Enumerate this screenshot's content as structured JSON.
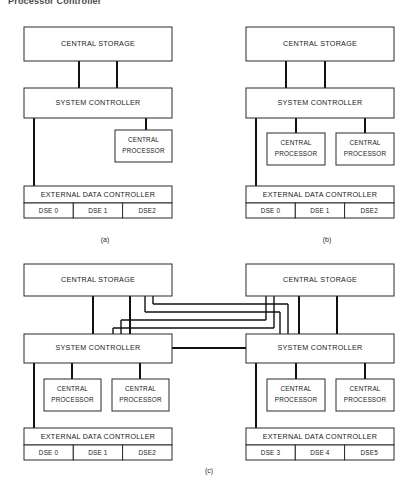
{
  "figure": {
    "title": "Processor Controller",
    "captions": {
      "a": "(a)",
      "b": "(b)",
      "c": "(c)"
    }
  },
  "labels": {
    "central_storage": "CENTRAL STORAGE",
    "system_controller": "SYSTEM CONTROLLER",
    "central_processor_line1": "CENTRAL",
    "central_processor_line2": "PROCESSOR",
    "external_data_controller": "EXTERNAL DATA CONTROLLER"
  },
  "panels": {
    "a": {
      "caption": "(a)",
      "central_storage": "CENTRAL STORAGE",
      "system_controller": "SYSTEM CONTROLLER",
      "external_data_controller": "EXTERNAL DATA CONTROLLER",
      "processors": [
        {
          "line1": "CENTRAL",
          "line2": "PROCESSOR"
        }
      ],
      "dse": [
        "DSE 0",
        "DSE 1",
        "DSE2"
      ]
    },
    "b": {
      "caption": "(b)",
      "central_storage": "CENTRAL STORAGE",
      "system_controller": "SYSTEM CONTROLLER",
      "external_data_controller": "EXTERNAL DATA CONTROLLER",
      "processors": [
        {
          "line1": "CENTRAL",
          "line2": "PROCESSOR"
        },
        {
          "line1": "CENTRAL",
          "line2": "PROCESSOR"
        }
      ],
      "dse": [
        "DSE 0",
        "DSE 1",
        "DSE2"
      ]
    },
    "c": {
      "caption": "(c)",
      "left": {
        "central_storage": "CENTRAL STORAGE",
        "system_controller": "SYSTEM CONTROLLER",
        "external_data_controller": "EXTERNAL DATA CONTROLLER",
        "processors": [
          {
            "line1": "CENTRAL",
            "line2": "PROCESSOR"
          },
          {
            "line1": "CENTRAL",
            "line2": "PROCESSOR"
          }
        ],
        "dse": [
          "DSE 0",
          "DSE 1",
          "DSE2"
        ]
      },
      "right": {
        "central_storage": "CENTRAL STORAGE",
        "system_controller": "SYSTEM CONTROLLER",
        "external_data_controller": "EXTERNAL DATA CONTROLLER",
        "processors": [
          {
            "line1": "CENTRAL",
            "line2": "PROCESSOR"
          },
          {
            "line1": "CENTRAL",
            "line2": "PROCESSOR"
          }
        ],
        "dse": [
          "DSE 3",
          "DSE 4",
          "DSE5"
        ]
      }
    }
  },
  "colors": {
    "background": "#ffffff",
    "line": "#111111",
    "box_stroke": "#2b2b2b",
    "text": "#1a1a1a"
  }
}
